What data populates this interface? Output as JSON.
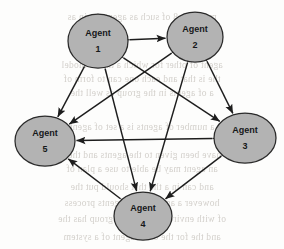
{
  "diagram": {
    "type": "directed-graph",
    "canvas": {
      "width": 284,
      "height": 249
    },
    "node_style": {
      "shape": "ellipse",
      "fill": "#b3b3b3",
      "stroke": "#2a2a2a",
      "text_color": "#16181a"
    },
    "edge_style": {
      "stroke": "#1d1d1d",
      "arrow": "double-headed",
      "directed": true,
      "bidirectional": true
    },
    "nodes": [
      {
        "id": "agent-1",
        "line1": "Agent",
        "line2": "1",
        "cx": 98,
        "cy": 41,
        "rx": 30,
        "ry": 27
      },
      {
        "id": "agent-2",
        "line1": "Agent",
        "line2": "2",
        "cx": 195,
        "cy": 37,
        "rx": 28,
        "ry": 25
      },
      {
        "id": "agent-3",
        "line1": "Agent",
        "line2": "3",
        "cx": 245,
        "cy": 138,
        "rx": 31,
        "ry": 25
      },
      {
        "id": "agent-4",
        "line1": "Agent",
        "line2": "4",
        "cx": 143,
        "cy": 216,
        "rx": 29,
        "ry": 24
      },
      {
        "id": "agent-5",
        "line1": "Agent",
        "line2": "5",
        "cx": 45,
        "cy": 141,
        "rx": 30,
        "ry": 25
      }
    ],
    "edges": [
      {
        "id": "edge-1-2",
        "from": "agent-1",
        "to": "agent-2",
        "bidirectional": true
      },
      {
        "id": "edge-1-3",
        "from": "agent-1",
        "to": "agent-3",
        "bidirectional": true
      },
      {
        "id": "edge-1-4",
        "from": "agent-1",
        "to": "agent-4",
        "bidirectional": true
      },
      {
        "id": "edge-1-5",
        "from": "agent-1",
        "to": "agent-5",
        "bidirectional": true
      },
      {
        "id": "edge-2-3",
        "from": "agent-2",
        "to": "agent-3",
        "bidirectional": true
      },
      {
        "id": "edge-2-4",
        "from": "agent-2",
        "to": "agent-4",
        "bidirectional": true
      },
      {
        "id": "edge-2-5",
        "from": "agent-2",
        "to": "agent-5",
        "bidirectional": true
      },
      {
        "id": "edge-3-4",
        "from": "agent-3",
        "to": "agent-4",
        "bidirectional": true
      },
      {
        "id": "edge-3-5",
        "from": "agent-3",
        "to": "agent-5",
        "bidirectional": true
      },
      {
        "id": "edge-4-5",
        "from": "agent-4",
        "to": "agent-5",
        "bidirectional": true
      }
    ]
  },
  "background_bleed": {
    "description": "faint reversed show-through text from the opposite page of the scan",
    "lines": [
      {
        "top": 12,
        "text": "mulative  8  of  such  as  agent  the  in  as"
      },
      {
        "top": 60,
        "text": "agent  of  other  for  which  a  the  be  model"
      },
      {
        "top": 74,
        "text": "the  is  that  and  each  one  can  to  form  of"
      },
      {
        "top": 88,
        "text": "a  of  agents  in  the  group  as  well  the"
      },
      {
        "top": 122,
        "text": "a  number  of  agents  is  a  set  of  agent"
      },
      {
        "top": 150,
        "text": "have  been  given  to  the  agents  and  they"
      },
      {
        "top": 164,
        "text": "an  agent  may  be  able  to  use  a  plan  of"
      },
      {
        "top": 182,
        "text": "and  can  in  a  the  that  should  put  the"
      },
      {
        "top": 198,
        "text": "however  a  agent  of  the  agents  process"
      },
      {
        "top": 214,
        "text": "of  with  environ  in  a  shared  group  has  the"
      },
      {
        "top": 232,
        "text": "and  the  for  the  other  agent  of  a  system"
      }
    ]
  }
}
